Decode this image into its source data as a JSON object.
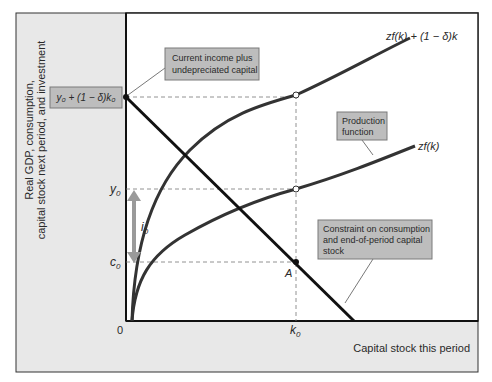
{
  "figure": {
    "y_axis_label_line1": "Real GDP, consumption,",
    "y_axis_label_line2": "capital stock next period, and investment",
    "x_axis_label": "Capital stock this period",
    "origin_label": "0",
    "colors": {
      "panel_bg": "#e8e8e8",
      "plot_bg": "#ffffff",
      "label_box": "#bdbdbd",
      "curve": "#333333",
      "constraint_line": "#111111",
      "arrow": "#9a9a9a",
      "dashed": "#777777"
    }
  },
  "tick_labels": {
    "y_top": "y₀ + (1 − δ)k₀",
    "y0": "y",
    "y0_sub": "0",
    "c0": "c",
    "c0_sub": "0",
    "k0": "k",
    "k0_sub": "0",
    "i0": "i",
    "i0_sub": "0",
    "point_A": "A"
  },
  "curves": {
    "upper_label": "zf(k) + (1 − δ)k",
    "lower_label": "zf(k)"
  },
  "annotations": {
    "income_box_line1": "Current income plus",
    "income_box_line2": "undepreciated capital",
    "production_box_line1": "Production",
    "production_box_line2": "function",
    "constraint_box_line1": "Constraint on consumption",
    "constraint_box_line2": "and end-of-period capital",
    "constraint_box_line3": "stock"
  }
}
